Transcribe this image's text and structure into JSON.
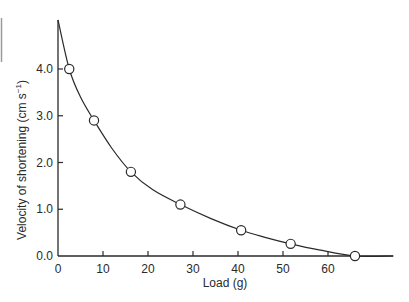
{
  "chart_data": {
    "type": "scatter",
    "title": "",
    "xlabel": "Load (g)",
    "ylabel": "Velocity of shortening (cm s⁻¹)",
    "ylabel_parts": {
      "main": "Velocity of shortening (cm s",
      "sup": "−1",
      "close": ")"
    },
    "xlim": [
      0,
      74.5
    ],
    "ylim": [
      0,
      5.05
    ],
    "x_ticks": [
      0,
      10,
      20,
      30,
      40,
      50,
      60
    ],
    "x_tick_labels": [
      "0",
      "10",
      "20",
      "30",
      "40",
      "50",
      "60"
    ],
    "y_ticks": [
      0,
      1,
      2,
      3,
      4
    ],
    "y_tick_labels": [
      "0.0",
      "1.0",
      "2.0",
      "3.0",
      "4.0"
    ],
    "grid": false,
    "legend": null,
    "series": [
      {
        "name": "measured",
        "marker": "open-circle",
        "x": [
          2.5,
          8.0,
          16.2,
          27.2,
          40.7,
          51.7,
          66.0
        ],
        "y": [
          4.0,
          2.9,
          1.8,
          1.1,
          0.55,
          0.26,
          0.0
        ]
      },
      {
        "name": "fitted curve",
        "marker": "line",
        "x": [
          0,
          2.5,
          5,
          8,
          12,
          16.2,
          21,
          27.2,
          34,
          40.7,
          46,
          51.7,
          58,
          66,
          74.5
        ],
        "y": [
          5.05,
          4.0,
          3.4,
          2.9,
          2.3,
          1.8,
          1.42,
          1.1,
          0.8,
          0.55,
          0.4,
          0.26,
          0.13,
          0.0,
          0.0
        ]
      }
    ]
  },
  "colors": {
    "ink": "#2a2a2a",
    "background": "#ffffff",
    "edge_mark": "#9a9a9a"
  }
}
